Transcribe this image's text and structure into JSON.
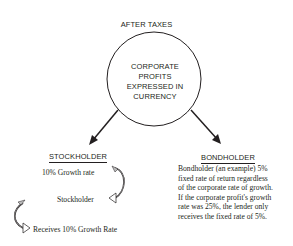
{
  "diagram": {
    "title": "AFTER TAXES",
    "center_node": {
      "lines": [
        "CORPORATE",
        "PROFITS",
        "EXPRESSED IN",
        "CURRENCY"
      ]
    },
    "left_branch": {
      "heading": "STOCKHOLDER",
      "rate_text": "10% Growth rate",
      "sub_text": "Stockholder",
      "receives_text": "Receives 10% Growth Rate"
    },
    "right_branch": {
      "heading": "BONDHOLDER",
      "description_lines": [
        "Bondholder (an example) 5%",
        "fixed rate of return regardless",
        "of the corporate rate of growth.",
        "If the corporate profit's growth",
        "rate was 25%, the lender only",
        "receives the fixed rate of 5%."
      ]
    },
    "colors": {
      "ink": "#231f20",
      "arrow_fill": "#bdbdbd"
    }
  }
}
